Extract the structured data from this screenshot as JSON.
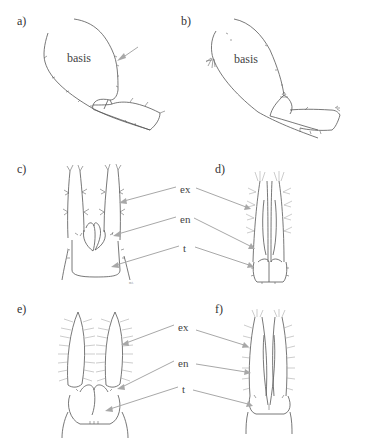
{
  "panels": {
    "a": {
      "label": "a)",
      "structure_label": "basis"
    },
    "b": {
      "label": "b)",
      "structure_label": "basis"
    },
    "c": {
      "label": "c)",
      "scale_mark": "m.t."
    },
    "d": {
      "label": "d)"
    },
    "e": {
      "label": "e)"
    },
    "f": {
      "label": "f)"
    }
  },
  "callouts": {
    "row2": {
      "ex": "ex",
      "en": "en",
      "t": "t"
    },
    "row3": {
      "ex": "ex",
      "en": "en",
      "t": "t"
    }
  },
  "colors": {
    "line": "#555555",
    "arrow": "#a8a8a8",
    "background": "#ffffff"
  }
}
